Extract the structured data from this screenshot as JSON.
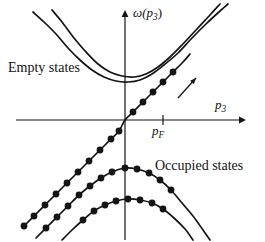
{
  "figure": {
    "background": "#ffffff",
    "ink": "#141414",
    "width": 265,
    "height": 242
  },
  "labels": {
    "y_axis": "ω(p3)",
    "y_axis_base": "ω(",
    "y_axis_var": "p",
    "y_axis_sub": "3",
    "y_axis_close": ")",
    "x_axis_var": "p",
    "x_axis_sub": "3",
    "fermi_var": "p",
    "fermi_sub": "F",
    "empty_states": "Empty states",
    "occupied_states": "Occupied states"
  },
  "axes": {
    "origin_x": 125,
    "origin_y": 120,
    "x_start": 16,
    "x_end": 246,
    "y_top": 10,
    "y_bottom": 240,
    "fermi_tick_x": 163,
    "tick_half_height": 5,
    "arrow_size": 6
  },
  "chart_data": {
    "type": "line",
    "title": "",
    "xlabel": "p3",
    "ylabel": "ω(p3)",
    "axis_origin_px": [
      125,
      120
    ],
    "grid": false,
    "legend": "none",
    "annotations": [
      {
        "text": "Empty states",
        "px": [
          8,
          60
        ]
      },
      {
        "text": "Occupied states",
        "px": [
          155,
          158
        ]
      },
      {
        "text": "pF",
        "px": [
          152,
          123
        ],
        "role": "fermi-momentum-tick-label"
      },
      {
        "type": "arrow",
        "from_px": [
          178,
          98
        ],
        "to_px": [
          196,
          78
        ],
        "role": "direction-arrow"
      }
    ],
    "series": [
      {
        "name": "upper-band-outer",
        "role": "empty-states-upper-parabola",
        "style": "solid",
        "markers": false,
        "points_px": [
          [
            33,
            12
          ],
          [
            44,
            22
          ],
          [
            56,
            34
          ],
          [
            68,
            48
          ],
          [
            80,
            60
          ],
          [
            92,
            70
          ],
          [
            104,
            77
          ],
          [
            116,
            81
          ],
          [
            128,
            82
          ],
          [
            140,
            80
          ],
          [
            152,
            74
          ],
          [
            164,
            65
          ],
          [
            178,
            53
          ],
          [
            192,
            38
          ],
          [
            206,
            24
          ],
          [
            220,
            11
          ],
          [
            228,
            4
          ]
        ]
      },
      {
        "name": "upper-band-inner",
        "role": "empty-states-lower-parabola",
        "style": "solid",
        "markers": false,
        "points_px": [
          [
            52,
            10
          ],
          [
            62,
            22
          ],
          [
            74,
            38
          ],
          [
            86,
            52
          ],
          [
            98,
            64
          ],
          [
            110,
            72
          ],
          [
            122,
            76
          ],
          [
            134,
            77
          ],
          [
            146,
            74
          ],
          [
            158,
            67
          ],
          [
            170,
            57
          ],
          [
            182,
            45
          ],
          [
            196,
            30
          ],
          [
            210,
            15
          ],
          [
            220,
            4
          ]
        ]
      },
      {
        "name": "linear-branch",
        "role": "fermi-linear-dispersion",
        "style": "solid",
        "markers": true,
        "marker_shape": "dot",
        "points_px": [
          [
            24,
            226
          ],
          [
            34,
            216
          ],
          [
            45,
            205
          ],
          [
            56,
            194
          ],
          [
            67,
            183
          ],
          [
            78,
            172
          ],
          [
            89,
            161
          ],
          [
            100,
            150
          ],
          [
            111,
            139
          ],
          [
            119,
            131
          ],
          [
            125,
            120
          ],
          [
            133,
            112
          ],
          [
            143,
            102
          ],
          [
            153,
            92
          ],
          [
            163,
            82
          ],
          [
            173,
            72
          ],
          [
            183,
            62
          ],
          [
            190,
            54
          ]
        ],
        "marker_points_px": [
          [
            24,
            226
          ],
          [
            34,
            216
          ],
          [
            45,
            205
          ],
          [
            56,
            194
          ],
          [
            67,
            183
          ],
          [
            78,
            172
          ],
          [
            89,
            161
          ],
          [
            100,
            150
          ],
          [
            111,
            139
          ],
          [
            119,
            131
          ],
          [
            133,
            112
          ],
          [
            143,
            102
          ],
          [
            153,
            92
          ],
          [
            163,
            82
          ],
          [
            173,
            72
          ]
        ]
      },
      {
        "name": "occupied-band-upper",
        "role": "occupied-states-upper-parabola",
        "style": "solid",
        "markers": true,
        "marker_shape": "dot",
        "points_px": [
          [
            36,
            238
          ],
          [
            46,
            228
          ],
          [
            57,
            217
          ],
          [
            68,
            206
          ],
          [
            79,
            195
          ],
          [
            90,
            186
          ],
          [
            101,
            178
          ],
          [
            112,
            172
          ],
          [
            125,
            168
          ],
          [
            137,
            169
          ],
          [
            149,
            173
          ],
          [
            160,
            180
          ],
          [
            171,
            190
          ],
          [
            182,
            203
          ],
          [
            193,
            216
          ],
          [
            203,
            230
          ],
          [
            210,
            240
          ]
        ],
        "marker_points_px": [
          [
            46,
            228
          ],
          [
            57,
            217
          ],
          [
            68,
            206
          ],
          [
            79,
            195
          ],
          [
            90,
            186
          ],
          [
            101,
            178
          ],
          [
            112,
            172
          ],
          [
            125,
            168
          ],
          [
            137,
            169
          ],
          [
            149,
            173
          ],
          [
            160,
            180
          ],
          [
            171,
            190
          ]
        ]
      },
      {
        "name": "occupied-band-lower",
        "role": "occupied-states-lower-parabola",
        "style": "solid",
        "markers": true,
        "marker_shape": "dot",
        "points_px": [
          [
            62,
            240
          ],
          [
            72,
            230
          ],
          [
            83,
            220
          ],
          [
            94,
            211
          ],
          [
            105,
            205
          ],
          [
            116,
            201
          ],
          [
            128,
            199
          ],
          [
            140,
            200
          ],
          [
            152,
            203
          ],
          [
            163,
            209
          ],
          [
            174,
            218
          ],
          [
            185,
            229
          ],
          [
            193,
            240
          ]
        ],
        "marker_points_px": [
          [
            83,
            220
          ],
          [
            94,
            211
          ],
          [
            105,
            205
          ],
          [
            116,
            201
          ],
          [
            128,
            199
          ],
          [
            140,
            200
          ],
          [
            152,
            203
          ],
          [
            163,
            209
          ]
        ]
      }
    ],
    "marker_radius_px": 3.4
  }
}
